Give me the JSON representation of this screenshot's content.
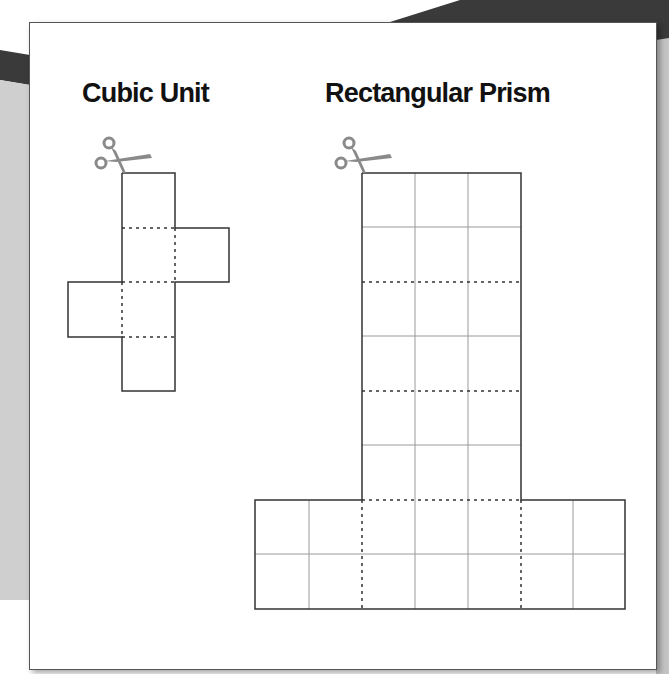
{
  "titles": {
    "cubic_unit": "Cubic Unit",
    "rectangular_prism": "Rectangular Prism"
  },
  "icons": {
    "cube_net": "scissors-icon",
    "prism_net": "scissors-icon"
  },
  "colors": {
    "outline": "#333333",
    "grid_line": "#9a9a9a",
    "fold_line": "#333333",
    "scissors": "#8a8a8a",
    "background_dark": "#3a3a3a",
    "background_light": "#c8c8c8"
  },
  "cube_net": {
    "square_size_px": 54,
    "faces": 6,
    "layout": "cross with flaps at rows 2 (right) and 3 (left)"
  },
  "prism_net": {
    "vertical_column": {
      "columns": 3,
      "rows": 6
    },
    "base_strip": {
      "columns": 7,
      "rows": 2
    },
    "fold_rows_at": [
      282,
      391,
      500
    ],
    "fold_cols_at": [
      362,
      521
    ]
  }
}
